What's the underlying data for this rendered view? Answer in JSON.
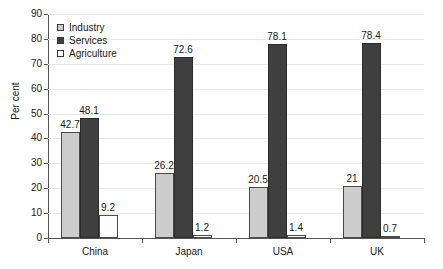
{
  "chart_data": {
    "type": "bar",
    "title": "",
    "xlabel": "",
    "ylabel": "Per cent",
    "ylim": [
      0,
      90
    ],
    "ytick_step": 10,
    "yticks": [
      90,
      80,
      70,
      60,
      50,
      40,
      30,
      20,
      10,
      0
    ],
    "ytick_labels": [
      "90",
      "80",
      "70",
      "60",
      "50",
      "40",
      "30",
      "20",
      "10",
      "0"
    ],
    "grid": true,
    "grid_axis": "y",
    "legend_position": "upper-left-inside",
    "categories": [
      "China",
      "Japan",
      "USA",
      "UK"
    ],
    "series": [
      {
        "name": "Industry",
        "color": "#cdcdcd",
        "values": [
          42.7,
          26.2,
          20.5,
          21
        ],
        "labels": [
          "42.7",
          "26.2",
          "20.5",
          "21"
        ]
      },
      {
        "name": "Services",
        "color": "#3f3f3f",
        "values": [
          48.1,
          72.6,
          78.1,
          78.4
        ],
        "labels": [
          "48.1",
          "72.6",
          "78.1",
          "78.4"
        ]
      },
      {
        "name": "Agriculture",
        "color": "#ffffff",
        "values": [
          9.2,
          1.2,
          1.4,
          0.7
        ],
        "labels": [
          "9.2",
          "1.2",
          "1.4",
          "0.7"
        ]
      }
    ]
  }
}
